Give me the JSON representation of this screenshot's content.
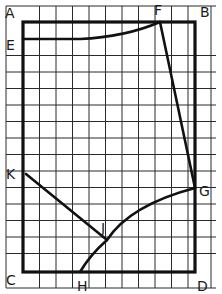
{
  "diagram": {
    "type": "drafting pattern on squared grid",
    "grid": {
      "cell_px": 16.5,
      "origin_x": 6,
      "origin_y": 6,
      "cols": 13,
      "rows": 17
    },
    "frame": {
      "corners": [
        "A",
        "B",
        "C",
        "D"
      ]
    },
    "points": {
      "A": {
        "label": "A",
        "x": 23,
        "y": 22
      },
      "B": {
        "label": "B",
        "x": 195,
        "y": 22
      },
      "C": {
        "label": "C",
        "x": 23,
        "y": 272
      },
      "D": {
        "label": "D",
        "x": 195,
        "y": 272
      },
      "E": {
        "label": "E",
        "x": 23,
        "y": 39
      },
      "F": {
        "label": "F",
        "x": 160,
        "y": 22
      },
      "G": {
        "label": "G",
        "x": 195,
        "y": 188
      },
      "H": {
        "label": "H",
        "x": 80,
        "y": 272
      },
      "J": {
        "label": "J",
        "x": 107,
        "y": 240
      },
      "K": {
        "label": "K",
        "x": 26,
        "y": 174
      }
    },
    "lines": [
      {
        "from": "A",
        "to": "B",
        "style": "frame"
      },
      {
        "from": "B",
        "to": "D",
        "style": "frame"
      },
      {
        "from": "D",
        "to": "C",
        "style": "frame"
      },
      {
        "from": "C",
        "to": "A",
        "style": "frame"
      },
      {
        "from": "E",
        "to": "F",
        "style": "curve"
      },
      {
        "from": "F",
        "to": "G",
        "style": "straight"
      },
      {
        "from": "G",
        "to": "H",
        "via": "J",
        "style": "curve"
      },
      {
        "from": "K",
        "to": "J",
        "style": "straight"
      }
    ]
  }
}
